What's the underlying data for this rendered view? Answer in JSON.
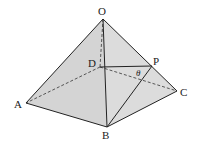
{
  "diagram": {
    "type": "square pyramid with point P on edge OC",
    "labels": {
      "O": "O",
      "A": "A",
      "B": "B",
      "C": "C",
      "D": "D",
      "P": "P",
      "angle": "θ"
    },
    "colors": {
      "face_fill": "#d6d6d6",
      "face_fill_light": "#e4e4e4",
      "edge": "#222222",
      "background": "#ffffff"
    }
  }
}
